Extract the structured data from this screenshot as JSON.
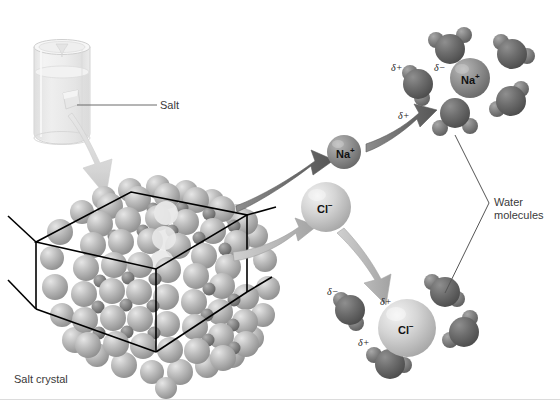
{
  "figure": {
    "width": 560,
    "height": 411,
    "background": "#ffffff"
  },
  "labels": {
    "salt": "Salt",
    "salt_crystal": "Salt crystal",
    "water_molecules_line1": "Water",
    "water_molecules_line2": "molecules"
  },
  "ions": {
    "sodium": {
      "symbol": "Na",
      "charge": "+",
      "color": "#8f8f8f",
      "cx": 344,
      "cy": 152,
      "r": 17
    },
    "chloride": {
      "symbol": "Cl",
      "charge": "−",
      "color": "#c9c9c9",
      "cx": 326,
      "cy": 207,
      "r": 25
    },
    "sodium_hydrated": {
      "symbol": "Na",
      "charge": "+",
      "color": "#9a9a9a",
      "cx": 470,
      "cy": 78,
      "r": 20
    },
    "chloride_hydrated": {
      "symbol": "Cl",
      "charge": "−",
      "color": "#d2d2d2",
      "cx": 407,
      "cy": 328,
      "r": 29
    }
  },
  "partial_charges": {
    "sodium_shell": [
      {
        "text": "δ+",
        "x": 391,
        "y": 62
      },
      {
        "text": "δ−",
        "x": 434,
        "y": 62
      },
      {
        "text": "δ+",
        "x": 398,
        "y": 110
      }
    ],
    "chloride_shell": [
      {
        "text": "δ−",
        "x": 327,
        "y": 286
      },
      {
        "text": "δ+",
        "x": 380,
        "y": 296
      },
      {
        "text": "δ+",
        "x": 358,
        "y": 337
      }
    ]
  },
  "colors": {
    "background": "#ffffff",
    "label_text": "#3a3a3a",
    "ion_text": "#111111",
    "oxygen_sphere": "#6b6b6b",
    "hydrogen_sphere": "#8a8a8a",
    "chloride_lattice": "#b4b4b4",
    "sodium_lattice": "#808080",
    "lattice_wireframe": "#000000",
    "leader_line": "#555555",
    "arrow_dark": "#6e6e6e",
    "arrow_light": "#b9b9b9",
    "arrow_pale": "#d8d8d8",
    "beaker_glass": "#ebebeb",
    "bottom_rule": "#dcdcdc"
  },
  "elements": {
    "beaker_name": "beaker-with-water",
    "crystal_name": "salt-crystal-lattice",
    "sodium_shell_name": "hydrated-sodium-ion",
    "chloride_shell_name": "hydrated-chloride-ion"
  },
  "water_molecules": {
    "sodium_shell_count": 5,
    "chloride_shell_count": 4
  },
  "arrows": [
    {
      "name": "beaker-to-crystal-arrow",
      "tone": "pale"
    },
    {
      "name": "crystal-to-sodium-arrow",
      "tone": "dark"
    },
    {
      "name": "crystal-to-chloride-arrow",
      "tone": "light"
    },
    {
      "name": "sodium-to-shell-arrow",
      "tone": "dark"
    },
    {
      "name": "chloride-to-shell-arrow",
      "tone": "light"
    }
  ]
}
